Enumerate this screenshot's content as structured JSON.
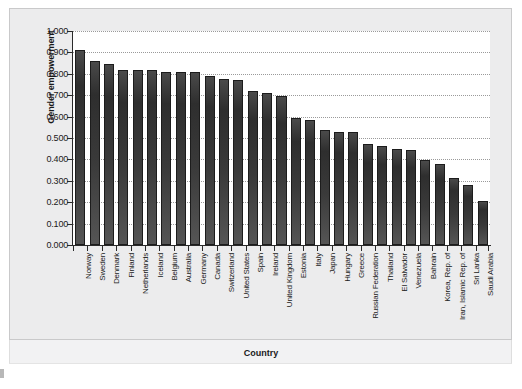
{
  "chart_data": {
    "type": "bar",
    "title": "",
    "xlabel": "Country",
    "ylabel": "Gender empowerment",
    "ylim": [
      0.0,
      1.0
    ],
    "grid": true,
    "legend": "none",
    "y_ticks": [
      "0.000",
      "0.100",
      "0.200",
      "0.300",
      "0.400",
      "0.500",
      "0.600",
      "0.700",
      "0.800",
      "0.900",
      "1.000"
    ],
    "y_tick_values": [
      0.0,
      0.1,
      0.2,
      0.3,
      0.4,
      0.5,
      0.6,
      0.7,
      0.8,
      0.9,
      1.0
    ],
    "categories": [
      "Norway",
      "Sweden",
      "Denmark",
      "Finland",
      "Netherlands",
      "Iceland",
      "Belgium",
      "Australia",
      "Germany",
      "Canada",
      "Switzerland",
      "United States",
      "Spain",
      "Ireland",
      "United Kingdom",
      "Estonia",
      "Italy",
      "Japan",
      "Hungary",
      "Greece",
      "Russian Federation",
      "Thailand",
      "El Salvador",
      "Venezuela",
      "Bahrain",
      "Korea, Rep. of",
      "Iran, Islamic Rep. of",
      "Sri Lanka",
      "Saudi Arabia"
    ],
    "values": [
      0.91,
      0.858,
      0.847,
      0.82,
      0.82,
      0.82,
      0.808,
      0.808,
      0.808,
      0.789,
      0.777,
      0.77,
      0.718,
      0.712,
      0.698,
      0.592,
      0.586,
      0.536,
      0.53,
      0.528,
      0.47,
      0.463,
      0.451,
      0.442,
      0.399,
      0.38,
      0.313,
      0.28,
      0.207
    ]
  },
  "figure": {
    "axis_color": "#2a2a2a",
    "bar_color": "#333333",
    "panel_bg": "#ececed",
    "plot_bg": "#ffffff",
    "grid_color": "#9a9a9a"
  }
}
